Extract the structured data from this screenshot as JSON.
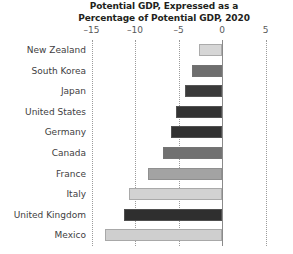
{
  "chart_data": {
    "type": "bar",
    "orientation": "horizontal",
    "title": "Potential GDP, Expressed as a Percentage of Potential GDP, 2020",
    "title_lines": [
      "Potential GDP, Expressed as a",
      "Percentage of Potential GDP, 2020"
    ],
    "xlabel": "",
    "ylabel": "",
    "categories": [
      "New Zealand",
      "South Korea",
      "Japan",
      "United States",
      "Germany",
      "Canada",
      "France",
      "Italy",
      "United Kingdom",
      "Mexico"
    ],
    "values": [
      -2.6,
      -3.4,
      -4.2,
      -5.3,
      -5.9,
      -6.8,
      -8.5,
      -10.7,
      -11.3,
      -13.4
    ],
    "bar_colors": [
      "#d6d6d6",
      "#6e6e6e",
      "#3a3a3a",
      "#333333",
      "#323232",
      "#717171",
      "#a3a3a3",
      "#d2d2d2",
      "#2f2f2f",
      "#cfcfcf"
    ],
    "xlim": [
      -16.5,
      6.5
    ],
    "xticks": [
      -15,
      -10,
      -5,
      0,
      5
    ],
    "xtick_labels": [
      "–15",
      "–10",
      "–5",
      "0",
      "5"
    ],
    "grid": "vertical-dotted",
    "zero_line": true,
    "legend": "none"
  }
}
